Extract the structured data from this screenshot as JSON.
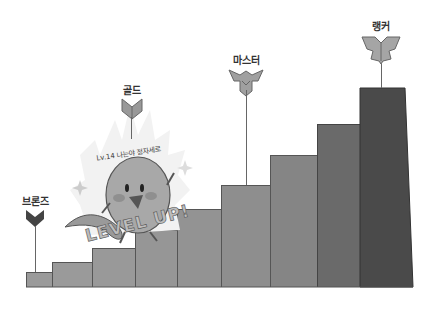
{
  "ranks": [
    {
      "label": "브론즈",
      "icon": "bronze-emblem-icon"
    },
    {
      "label": "골드",
      "icon": "gold-emblem-icon"
    },
    {
      "label": "마스터",
      "icon": "master-emblem-icon"
    },
    {
      "label": "랭커",
      "icon": "ranker-emblem-icon"
    }
  ],
  "character": {
    "speech": "Lv.14 나는야 정자세로",
    "banner": "LEVEL UP!"
  },
  "steps": [
    {
      "color": "#9a9a9a"
    },
    {
      "color": "#9a9a9a"
    },
    {
      "color": "#9a9a9a"
    },
    {
      "color": "#969696"
    },
    {
      "color": "#939393"
    },
    {
      "color": "#8e8e8e"
    },
    {
      "color": "#858585"
    },
    {
      "color": "#6a6a6a"
    },
    {
      "color": "#4a4a4a"
    }
  ]
}
